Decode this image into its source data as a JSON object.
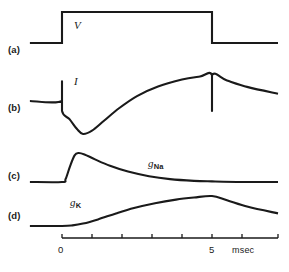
{
  "figure": {
    "background_color": "#ffffff",
    "line_color": "#1a1a1a",
    "row_labels": [
      {
        "id": "a",
        "text": "(a)",
        "x": 8,
        "y": 50
      },
      {
        "id": "b",
        "text": "(b)",
        "x": 8,
        "y": 108
      },
      {
        "id": "c",
        "text": "(c)",
        "x": 8,
        "y": 176
      },
      {
        "id": "d",
        "text": "(d)",
        "x": 8,
        "y": 216
      }
    ],
    "trace_labels": [
      {
        "id": "V",
        "text": "V",
        "x": 74,
        "y": 26
      },
      {
        "id": "I",
        "text": "I",
        "x": 74,
        "y": 82
      }
    ],
    "conductance_labels": [
      {
        "id": "g_Na",
        "base": "g",
        "sub": "Na",
        "x": 148,
        "y": 164
      },
      {
        "id": "g_K",
        "base": "g",
        "sub": "K",
        "x": 70,
        "y": 203
      }
    ],
    "axis": {
      "label_unit": "msec",
      "unit_x": 232,
      "unit_y": 248,
      "x_start": 62,
      "x_end": 278,
      "y": 238,
      "tick_labels": [
        {
          "text": "0",
          "value": 0,
          "x": 62
        },
        {
          "text": "5",
          "value": 5,
          "x": 212
        }
      ],
      "ticks": [
        0,
        1,
        2,
        3,
        4,
        5,
        6
      ],
      "tick_spacing_px": 30,
      "range": [
        0,
        7.2
      ]
    }
  },
  "chart_data": {
    "type": "line",
    "title": "",
    "xlabel": "msec",
    "ylabel": "",
    "xlim": [
      0,
      7.2
    ],
    "grid": false,
    "legend": "none",
    "series": [
      {
        "name": "V",
        "panel": "a",
        "description": "Voltage clamp step: depolarizing rectangular pulse from 0 to 5 msec",
        "points": [
          [
            -1.07,
            0
          ],
          [
            0.0,
            0
          ],
          [
            0.0,
            1
          ],
          [
            5.0,
            1
          ],
          [
            5.0,
            0
          ],
          [
            7.2,
            0
          ]
        ]
      },
      {
        "name": "I",
        "panel": "b",
        "description": "Membrane current: capacitive spike, early inward (downward) transient, then late outward current; tail at step off",
        "points": [
          [
            -1.07,
            0
          ],
          [
            0.0,
            0
          ],
          [
            0.0,
            0.6
          ],
          [
            0.0,
            -0.3
          ],
          [
            0.25,
            -0.55
          ],
          [
            0.5,
            -0.85
          ],
          [
            0.7,
            -1.0
          ],
          [
            1.0,
            -0.9
          ],
          [
            1.4,
            -0.6
          ],
          [
            1.9,
            -0.22
          ],
          [
            2.5,
            0.15
          ],
          [
            3.2,
            0.44
          ],
          [
            4.0,
            0.65
          ],
          [
            4.6,
            0.74
          ],
          [
            5.0,
            0.78
          ],
          [
            5.0,
            -0.3
          ],
          [
            5.0,
            0.78
          ],
          [
            5.5,
            0.62
          ],
          [
            6.2,
            0.42
          ],
          [
            7.2,
            0.22
          ]
        ]
      },
      {
        "name": "g_Na",
        "panel": "c",
        "description": "Sodium conductance: fast rise to early peak then inactivation decay to baseline",
        "points": [
          [
            -1.07,
            0
          ],
          [
            0.0,
            0
          ],
          [
            0.12,
            0.1
          ],
          [
            0.27,
            0.55
          ],
          [
            0.42,
            0.92
          ],
          [
            0.55,
            1.0
          ],
          [
            0.75,
            0.95
          ],
          [
            1.1,
            0.78
          ],
          [
            1.6,
            0.56
          ],
          [
            2.2,
            0.36
          ],
          [
            2.9,
            0.2
          ],
          [
            3.6,
            0.1
          ],
          [
            4.4,
            0.04
          ],
          [
            5.0,
            0.02
          ],
          [
            6.0,
            0.0
          ],
          [
            7.2,
            0.0
          ]
        ]
      },
      {
        "name": "g_K",
        "panel": "d",
        "description": "Potassium conductance: delayed sigmoid rise to plateau, then decay after step off",
        "points": [
          [
            -1.07,
            0
          ],
          [
            0.0,
            0
          ],
          [
            0.35,
            0.02
          ],
          [
            0.7,
            0.08
          ],
          [
            1.2,
            0.22
          ],
          [
            1.8,
            0.42
          ],
          [
            2.4,
            0.6
          ],
          [
            3.1,
            0.76
          ],
          [
            3.8,
            0.88
          ],
          [
            4.4,
            0.95
          ],
          [
            5.0,
            1.0
          ],
          [
            5.5,
            0.86
          ],
          [
            6.2,
            0.64
          ],
          [
            7.2,
            0.42
          ]
        ]
      }
    ]
  }
}
